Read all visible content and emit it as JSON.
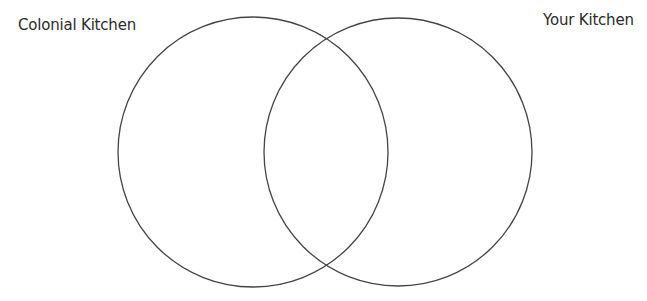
{
  "diagram": {
    "type": "venn",
    "sets": [
      {
        "label": "Colonial Kitchen",
        "cx": 253,
        "cy": 152,
        "r": 135
      },
      {
        "label": "Your Kitchen",
        "cx": 398,
        "cy": 152,
        "r": 134
      }
    ],
    "stroke_color": "#444444"
  }
}
